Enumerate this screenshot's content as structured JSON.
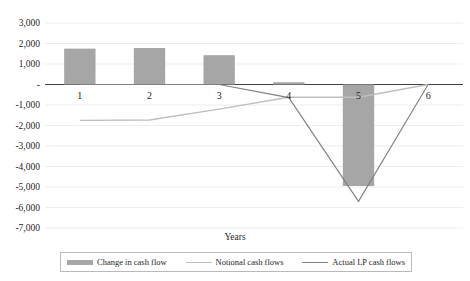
{
  "chart_data": {
    "type": "bar",
    "title": "",
    "xlabel": "Years",
    "ylabel": "",
    "categories": [
      "1",
      "2",
      "3",
      "4",
      "5",
      "6"
    ],
    "ylim": [
      -7000,
      3000
    ],
    "ytick_labels": [
      "3,000",
      "2,000",
      "1,000",
      "-",
      "-1,000",
      "-2,000",
      "-3,000",
      "-4,000",
      "-5,000",
      "-6,000",
      "-7,000"
    ],
    "ytick_values": [
      3000,
      2000,
      1000,
      0,
      -1000,
      -2000,
      -3000,
      -4000,
      -5000,
      -6000,
      -7000
    ],
    "grid": true,
    "legend_position": "bottom",
    "series": [
      {
        "name": "Change in cash flow",
        "type": "bar",
        "color": "#a6a6a6",
        "values": [
          1750,
          1780,
          1430,
          110,
          -4950,
          0
        ]
      },
      {
        "name": "Notional cash flows",
        "type": "line",
        "color": "#bfbfbf",
        "values": [
          -1750,
          -1730,
          -1200,
          -620,
          -620,
          0
        ]
      },
      {
        "name": "Actual LP cash flows",
        "type": "line",
        "color": "#808080",
        "values": [
          0,
          0,
          0,
          -640,
          -5700,
          0
        ]
      }
    ]
  },
  "legend": {
    "items": [
      {
        "label": "Change in cash flow",
        "marker": "bar-swatch",
        "color": "#a6a6a6"
      },
      {
        "label": "Notional cash flows",
        "marker": "line-swatch-light",
        "color": "#bfbfbf"
      },
      {
        "label": "Actual LP cash flows",
        "marker": "line-swatch-dark",
        "color": "#808080"
      }
    ]
  },
  "axis": {
    "x_title": "Years"
  }
}
